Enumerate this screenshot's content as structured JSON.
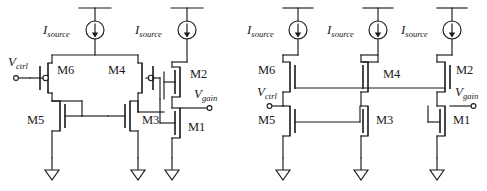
{
  "figure": {
    "type": "circuit-schematic",
    "background_color": "#ffffff",
    "line_color": "#1a1a1a"
  },
  "circuits": [
    {
      "id": "left-circuit",
      "name": "left-schematic",
      "transistor_labels": [
        "M6",
        "M4",
        "M2",
        "M5",
        "M3",
        "M1"
      ],
      "port_labels": [
        {
          "name": "vctrl",
          "base": "V",
          "sub": "ctrl"
        },
        {
          "name": "vgain",
          "base": "V",
          "sub": "gain"
        }
      ],
      "current_sources": [
        {
          "name": "isource-1",
          "base": "I",
          "sub": "source"
        },
        {
          "name": "isource-2",
          "base": "I",
          "sub": "source"
        }
      ],
      "ground_count": 3
    },
    {
      "id": "right-circuit",
      "name": "right-schematic",
      "transistor_labels": [
        "M6",
        "M4",
        "M2",
        "M5",
        "M3",
        "M1"
      ],
      "port_labels": [
        {
          "name": "vctrl",
          "base": "V",
          "sub": "ctrl"
        },
        {
          "name": "vgain",
          "base": "V",
          "sub": "gain"
        }
      ],
      "current_sources": [
        {
          "name": "isource-1",
          "base": "I",
          "sub": "source"
        },
        {
          "name": "isource-2",
          "base": "I",
          "sub": "source"
        },
        {
          "name": "isource-3",
          "base": "I",
          "sub": "source"
        }
      ],
      "ground_count": 3
    }
  ],
  "labels": {
    "m1": "M1",
    "m2": "M2",
    "m3": "M3",
    "m4": "M4",
    "m5": "M5",
    "m6": "M6",
    "i_base": "I",
    "i_sub": "source",
    "v_base": "V",
    "vctrl_sub": "ctrl",
    "vgain_sub": "gain"
  }
}
